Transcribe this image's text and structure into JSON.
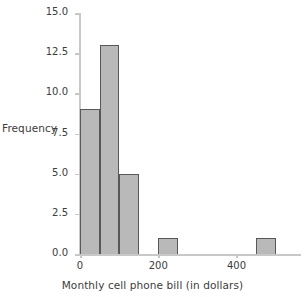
{
  "chart_data": {
    "type": "bar",
    "title": "",
    "xlabel": "Monthly cell phone bill (in dollars)",
    "ylabel": "Frequency",
    "bin_width": 50,
    "bin_starts": [
      0,
      50,
      100,
      150,
      200,
      250,
      300,
      350,
      400,
      450
    ],
    "categories": [
      "0-50",
      "50-100",
      "100-150",
      "150-200",
      "200-250",
      "250-300",
      "300-350",
      "350-400",
      "400-450",
      "450-500"
    ],
    "values": [
      9,
      13,
      5,
      0,
      1,
      0,
      0,
      0,
      0,
      1
    ],
    "xlim": [
      0,
      565
    ],
    "ylim": [
      0,
      15
    ],
    "xticks": [
      0,
      200,
      400
    ],
    "xtick_labels": [
      "0",
      "200",
      "400"
    ],
    "yticks": [
      0.0,
      2.5,
      5.0,
      7.5,
      10.0,
      12.5,
      15.0
    ],
    "ytick_labels": [
      "0.0",
      "2.5",
      "5.0",
      "7.5",
      "10.0",
      "12.5",
      "15.0"
    ],
    "grid": false,
    "legend": false,
    "bar_fill_color": "#b9b9b9",
    "bar_edge_color": "#585858",
    "axis_color": "#c8c8c8",
    "text_color": "#3c3c3c"
  }
}
